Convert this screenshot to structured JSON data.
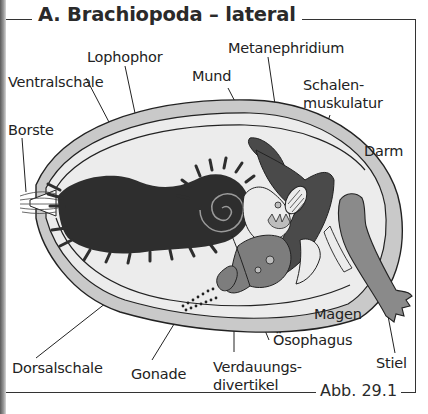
{
  "figure": {
    "title": "A. Brachiopoda – lateral",
    "figure_number": "Abb. 29.1"
  },
  "labels": {
    "lophophor": "Lophophor",
    "metanephridium": "Metanephridium",
    "ventralschale": "Ventralschale",
    "mund": "Mund",
    "schalenmuskulatur_1": "Schalen-",
    "schalenmuskulatur_2": "muskulatur",
    "borste": "Borste",
    "darm": "Darm",
    "magen": "Magen",
    "oesophagus": "Ösophagus",
    "stiel": "Stiel",
    "dorsalschale": "Dorsalschale",
    "gonade": "Gonade",
    "verdauungsdivertikel_1": "Verdauungs-",
    "verdauungsdivertikel_2": "divertikel"
  },
  "colors": {
    "shell": "#c9c9c9",
    "mantle_cavity": "#ececec",
    "lophophore": "#2e2e2e",
    "organs_mid": "#7d7d7d",
    "organs_dark": "#4a4a4a",
    "stalk": "#8a8a8a",
    "outline": "#222222"
  }
}
